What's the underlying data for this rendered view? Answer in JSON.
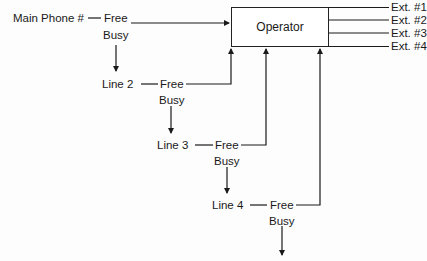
{
  "diagram": {
    "operator_label": "Operator",
    "main_phone_label": "Main Phone #",
    "lines": [
      {
        "label": "Line 2"
      },
      {
        "label": "Line 3"
      },
      {
        "label": "Line 4"
      }
    ],
    "state_free": "Free",
    "state_busy": "Busy",
    "extensions": [
      "Ext. #1",
      "Ext. #2",
      "Ext. #3",
      "Ext. #4"
    ],
    "colors": {
      "line": "#1a1a1a",
      "background": "#fdfdfd"
    }
  }
}
